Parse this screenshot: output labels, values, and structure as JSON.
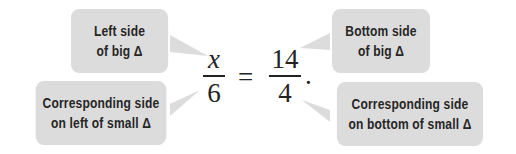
{
  "callouts": {
    "top_left": {
      "line1": "Left side",
      "line2": "of big Δ"
    },
    "bottom_left": {
      "line1": "Corresponding side",
      "line2": "on left of small Δ"
    },
    "top_right": {
      "line1": "Bottom side",
      "line2": "of big Δ"
    },
    "bottom_right": {
      "line1": "Corresponding side",
      "line2": "on bottom of small Δ"
    }
  },
  "equation": {
    "left_numerator": "x",
    "left_denominator": "6",
    "equals": "=",
    "right_numerator": "14",
    "right_denominator": "4",
    "terminator": "."
  },
  "colors": {
    "callout_fill": "#dcdcdc",
    "text": "#262626"
  }
}
